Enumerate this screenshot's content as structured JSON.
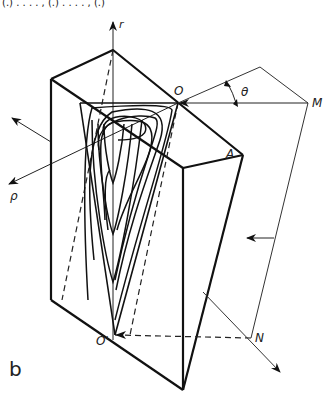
{
  "figure": {
    "panel_label": "b",
    "top_caption_fragment": "(.)  . . . . , (.)  . . . . , (.)",
    "labels": {
      "r_axis": "r",
      "rho_axis": "ρ",
      "origin": "O",
      "origin_prime": "O'",
      "point_a": "A",
      "point_m": "M",
      "point_n": "N",
      "angle": "θ"
    }
  },
  "colors": {
    "ink": "#111111",
    "thin_ink": "#333333",
    "background": "#ffffff"
  }
}
